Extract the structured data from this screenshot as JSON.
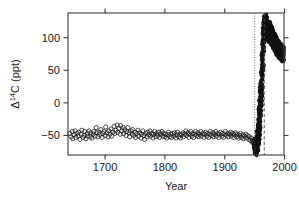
{
  "chart_data": {
    "type": "scatter",
    "title": "",
    "xlabel": "Year",
    "ylabel": "Δ¹⁴C (ppt)",
    "ylabel_parts": {
      "delta": "Δ",
      "sup": "14",
      "rest": "C (ppt)"
    },
    "xlim": [
      1638,
      1999
    ],
    "ylim": [
      -80,
      138
    ],
    "xticks": [
      1700,
      1800,
      1900,
      2000
    ],
    "xticklabels": [
      "1700",
      "1800",
      "1900",
      "2000"
    ],
    "yticks": [
      -50,
      0,
      50,
      100
    ],
    "yticklabels": [
      "−50",
      "0",
      "50",
      "100"
    ],
    "grid": false,
    "legend": null,
    "marker": "open-circle",
    "marker_size_px": 2.1,
    "annotations": [
      {
        "name": "bomb-onset-line",
        "type": "vline",
        "x": 1950,
        "style": "dotted"
      },
      {
        "name": "bomb-peak-line",
        "type": "vline",
        "x": 1966,
        "style": "dashed"
      }
    ],
    "series": [
      {
        "name": "Atmospheric Δ14C",
        "points": [
          [
            1641,
            -47
          ],
          [
            1643,
            -52
          ],
          [
            1645,
            -44
          ],
          [
            1646,
            -55
          ],
          [
            1648,
            -49
          ],
          [
            1650,
            -43
          ],
          [
            1651,
            -53
          ],
          [
            1653,
            -47
          ],
          [
            1655,
            -51
          ],
          [
            1656,
            -45
          ],
          [
            1658,
            -56
          ],
          [
            1660,
            -48
          ],
          [
            1661,
            -42
          ],
          [
            1663,
            -53
          ],
          [
            1665,
            -50
          ],
          [
            1666,
            -44
          ],
          [
            1668,
            -55
          ],
          [
            1670,
            -47
          ],
          [
            1671,
            -51
          ],
          [
            1673,
            -43
          ],
          [
            1675,
            -52
          ],
          [
            1676,
            -46
          ],
          [
            1678,
            -54
          ],
          [
            1680,
            -48
          ],
          [
            1681,
            -44
          ],
          [
            1683,
            -51
          ],
          [
            1685,
            -38
          ],
          [
            1686,
            -46
          ],
          [
            1688,
            -52
          ],
          [
            1690,
            -45
          ],
          [
            1691,
            -49
          ],
          [
            1693,
            -41
          ],
          [
            1695,
            -53
          ],
          [
            1696,
            -47
          ],
          [
            1698,
            -44
          ],
          [
            1700,
            -50
          ],
          [
            1701,
            -37
          ],
          [
            1703,
            -46
          ],
          [
            1705,
            -52
          ],
          [
            1706,
            -43
          ],
          [
            1708,
            -48
          ],
          [
            1710,
            -40
          ],
          [
            1711,
            -51
          ],
          [
            1713,
            -45
          ],
          [
            1715,
            -36
          ],
          [
            1716,
            -47
          ],
          [
            1718,
            -42
          ],
          [
            1720,
            -34
          ],
          [
            1721,
            -45
          ],
          [
            1723,
            -39
          ],
          [
            1725,
            -48
          ],
          [
            1726,
            -35
          ],
          [
            1728,
            -43
          ],
          [
            1730,
            -38
          ],
          [
            1731,
            -47
          ],
          [
            1733,
            -41
          ],
          [
            1735,
            -50
          ],
          [
            1736,
            -44
          ],
          [
            1738,
            -38
          ],
          [
            1740,
            -46
          ],
          [
            1741,
            -52
          ],
          [
            1743,
            -43
          ],
          [
            1745,
            -48
          ],
          [
            1746,
            -41
          ],
          [
            1748,
            -50
          ],
          [
            1750,
            -45
          ],
          [
            1751,
            -53
          ],
          [
            1753,
            -47
          ],
          [
            1755,
            -42
          ],
          [
            1756,
            -51
          ],
          [
            1758,
            -46
          ],
          [
            1760,
            -54
          ],
          [
            1761,
            -48
          ],
          [
            1763,
            -43
          ],
          [
            1765,
            -50
          ],
          [
            1766,
            -56
          ],
          [
            1768,
            -47
          ],
          [
            1770,
            -52
          ],
          [
            1771,
            -45
          ],
          [
            1773,
            -49
          ],
          [
            1775,
            -43
          ],
          [
            1776,
            -51
          ],
          [
            1778,
            -47
          ],
          [
            1780,
            -54
          ],
          [
            1781,
            -48
          ],
          [
            1783,
            -44
          ],
          [
            1785,
            -52
          ],
          [
            1786,
            -47
          ],
          [
            1788,
            -50
          ],
          [
            1790,
            -45
          ],
          [
            1791,
            -53
          ],
          [
            1793,
            -48
          ],
          [
            1795,
            -44
          ],
          [
            1796,
            -51
          ],
          [
            1798,
            -47
          ],
          [
            1800,
            -52
          ],
          [
            1801,
            -48
          ],
          [
            1803,
            -54
          ],
          [
            1805,
            -49
          ],
          [
            1806,
            -45
          ],
          [
            1808,
            -52
          ],
          [
            1810,
            -48
          ],
          [
            1811,
            -53
          ],
          [
            1813,
            -47
          ],
          [
            1815,
            -51
          ],
          [
            1816,
            -46
          ],
          [
            1818,
            -54
          ],
          [
            1820,
            -49
          ],
          [
            1821,
            -45
          ],
          [
            1823,
            -52
          ],
          [
            1825,
            -48
          ],
          [
            1826,
            -54
          ],
          [
            1828,
            -49
          ],
          [
            1830,
            -46
          ],
          [
            1831,
            -52
          ],
          [
            1833,
            -48
          ],
          [
            1835,
            -43
          ],
          [
            1836,
            -50
          ],
          [
            1838,
            -46
          ],
          [
            1840,
            -53
          ],
          [
            1841,
            -48
          ],
          [
            1843,
            -44
          ],
          [
            1845,
            -51
          ],
          [
            1846,
            -47
          ],
          [
            1848,
            -53
          ],
          [
            1850,
            -48
          ],
          [
            1851,
            -44
          ],
          [
            1853,
            -50
          ],
          [
            1855,
            -46
          ],
          [
            1856,
            -52
          ],
          [
            1858,
            -48
          ],
          [
            1860,
            -44
          ],
          [
            1861,
            -51
          ],
          [
            1863,
            -47
          ],
          [
            1865,
            -53
          ],
          [
            1866,
            -48
          ],
          [
            1868,
            -45
          ],
          [
            1870,
            -51
          ],
          [
            1871,
            -47
          ],
          [
            1873,
            -53
          ],
          [
            1875,
            -48
          ],
          [
            1876,
            -44
          ],
          [
            1878,
            -50
          ],
          [
            1880,
            -46
          ],
          [
            1881,
            -52
          ],
          [
            1883,
            -48
          ],
          [
            1885,
            -44
          ],
          [
            1886,
            -51
          ],
          [
            1888,
            -47
          ],
          [
            1890,
            -53
          ],
          [
            1891,
            -48
          ],
          [
            1893,
            -45
          ],
          [
            1895,
            -51
          ],
          [
            1896,
            -47
          ],
          [
            1898,
            -53
          ],
          [
            1900,
            -48
          ],
          [
            1901,
            -44
          ],
          [
            1903,
            -50
          ],
          [
            1905,
            -47
          ],
          [
            1906,
            -52
          ],
          [
            1908,
            -48
          ],
          [
            1910,
            -45
          ],
          [
            1911,
            -51
          ],
          [
            1913,
            -47
          ],
          [
            1915,
            -53
          ],
          [
            1916,
            -49
          ],
          [
            1918,
            -46
          ],
          [
            1920,
            -52
          ],
          [
            1921,
            -48
          ],
          [
            1923,
            -54
          ],
          [
            1925,
            -50
          ],
          [
            1926,
            -47
          ],
          [
            1928,
            -53
          ],
          [
            1930,
            -49
          ],
          [
            1931,
            -55
          ],
          [
            1933,
            -51
          ],
          [
            1935,
            -48
          ],
          [
            1936,
            -54
          ],
          [
            1938,
            -50
          ],
          [
            1940,
            -56
          ],
          [
            1941,
            -52
          ],
          [
            1943,
            -58
          ],
          [
            1945,
            -54
          ],
          [
            1946,
            -60
          ],
          [
            1947,
            -57
          ],
          [
            1948,
            -62
          ],
          [
            1949,
            -58
          ],
          [
            1950,
            -64
          ],
          [
            1950,
            -70
          ],
          [
            1951,
            -60
          ],
          [
            1951,
            -72
          ],
          [
            1952,
            -66
          ],
          [
            1952,
            -75
          ],
          [
            1953,
            -62
          ],
          [
            1953,
            -70
          ],
          [
            1954,
            -55
          ],
          [
            1954,
            -68
          ],
          [
            1955,
            -48
          ],
          [
            1955,
            -62
          ],
          [
            1956,
            -40
          ],
          [
            1956,
            -58
          ],
          [
            1957,
            -28
          ],
          [
            1957,
            -50
          ],
          [
            1958,
            -10
          ],
          [
            1958,
            -35
          ],
          [
            1959,
            5
          ],
          [
            1959,
            -20
          ],
          [
            1960,
            18
          ],
          [
            1960,
            -5
          ],
          [
            1961,
            30
          ],
          [
            1961,
            10
          ],
          [
            1962,
            48
          ],
          [
            1962,
            25
          ],
          [
            1963,
            72
          ],
          [
            1963,
            55
          ],
          [
            1964,
            95
          ],
          [
            1964,
            80
          ],
          [
            1965,
            110
          ],
          [
            1965,
            98
          ],
          [
            1966,
            122
          ],
          [
            1966,
            112
          ],
          [
            1967,
            128
          ],
          [
            1967,
            118
          ],
          [
            1968,
            130
          ],
          [
            1968,
            120
          ],
          [
            1969,
            126
          ],
          [
            1969,
            115
          ],
          [
            1970,
            122
          ],
          [
            1970,
            110
          ],
          [
            1971,
            118
          ],
          [
            1971,
            105
          ],
          [
            1972,
            114
          ],
          [
            1972,
            102
          ],
          [
            1973,
            112
          ],
          [
            1973,
            100
          ],
          [
            1974,
            116
          ],
          [
            1974,
            104
          ],
          [
            1975,
            118
          ],
          [
            1975,
            106
          ],
          [
            1976,
            115
          ],
          [
            1976,
            103
          ],
          [
            1977,
            112
          ],
          [
            1977,
            100
          ],
          [
            1978,
            110
          ],
          [
            1978,
            98
          ],
          [
            1979,
            108
          ],
          [
            1979,
            96
          ],
          [
            1980,
            106
          ],
          [
            1980,
            94
          ],
          [
            1981,
            104
          ],
          [
            1981,
            92
          ],
          [
            1982,
            102
          ],
          [
            1982,
            90
          ],
          [
            1983,
            100
          ],
          [
            1983,
            88
          ],
          [
            1984,
            98
          ],
          [
            1984,
            86
          ],
          [
            1985,
            96
          ],
          [
            1985,
            85
          ],
          [
            1986,
            94
          ],
          [
            1986,
            83
          ],
          [
            1987,
            92
          ],
          [
            1987,
            81
          ],
          [
            1988,
            90
          ],
          [
            1988,
            80
          ],
          [
            1989,
            89
          ],
          [
            1989,
            78
          ],
          [
            1990,
            88
          ],
          [
            1990,
            77
          ],
          [
            1991,
            86
          ],
          [
            1991,
            76
          ],
          [
            1992,
            85
          ],
          [
            1992,
            75
          ],
          [
            1993,
            84
          ],
          [
            1993,
            74
          ],
          [
            1994,
            83
          ],
          [
            1994,
            73
          ],
          [
            1995,
            82
          ],
          [
            1995,
            72
          ],
          [
            1996,
            81
          ],
          [
            1996,
            71
          ],
          [
            1997,
            80
          ],
          [
            1997,
            70
          ]
        ]
      }
    ]
  }
}
